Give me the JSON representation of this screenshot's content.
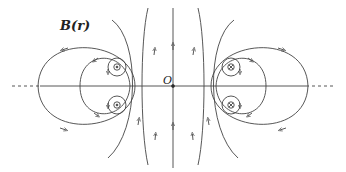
{
  "diagram": {
    "labels": {
      "field": "B(r)",
      "origin": "O"
    },
    "symbols": {
      "out_of_page": "⊙",
      "into_page": "⊗"
    },
    "conductors": [
      {
        "position": "upper-left",
        "x": 117,
        "y": 67,
        "direction": "out_of_page"
      },
      {
        "position": "lower-left",
        "x": 117,
        "y": 105,
        "direction": "out_of_page"
      },
      {
        "position": "upper-right",
        "x": 231,
        "y": 67,
        "direction": "into_page"
      },
      {
        "position": "lower-right",
        "x": 231,
        "y": 105,
        "direction": "into_page"
      }
    ],
    "colors": {
      "line": "#444444",
      "background": "#ffffff"
    }
  }
}
